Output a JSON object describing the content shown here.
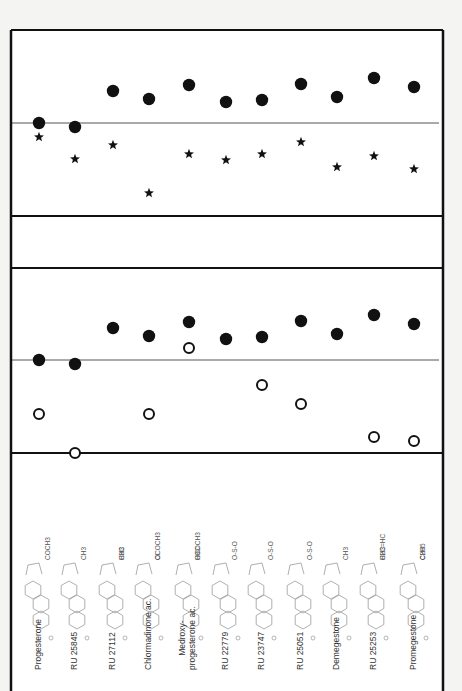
{
  "figure": {
    "background": "#ffffff",
    "ink": "#111111",
    "panels": [
      {
        "name": "panel-top",
        "top": 30,
        "bottom": 216,
        "reference_line_y": 123
      },
      {
        "name": "panel-gap",
        "top": 216,
        "bottom": 268
      },
      {
        "name": "panel-middle",
        "top": 268,
        "bottom": 453,
        "reference_line_y": 360
      },
      {
        "name": "panel-structures",
        "top": 453,
        "bottom": 691
      }
    ],
    "compounds": [
      {
        "name": "Progesterone",
        "x": 39
      },
      {
        "name": "RU 25845",
        "x": 75
      },
      {
        "name": "RU 27112",
        "x": 113
      },
      {
        "name": "Chlormadinone ac.",
        "x": 149
      },
      {
        "name": "Medroxy-",
        "name2": "progesterone ac.",
        "x": 189
      },
      {
        "name": "RU 22779",
        "x": 226
      },
      {
        "name": "RU 23747",
        "x": 262
      },
      {
        "name": "RU 25051",
        "x": 301
      },
      {
        "name": "Demegestone",
        "x": 337
      },
      {
        "name": "RU 25253",
        "x": 374
      },
      {
        "name": "Promegestone",
        "x": 414
      }
    ],
    "substituents": [
      {
        "text": "COCH3",
        "col": 0
      },
      {
        "text": "CH3",
        "col": 1
      },
      {
        "text": "CH3",
        "col": 2
      },
      {
        "text": "H3C",
        "col": 2
      },
      {
        "text": "OCOCH3",
        "col": 3
      },
      {
        "text": "Cl",
        "col": 3
      },
      {
        "text": "OCOCH3",
        "col": 4
      },
      {
        "text": "H3C",
        "col": 4
      },
      {
        "text": "O-S-O",
        "col": 5
      },
      {
        "text": "O-S-O",
        "col": 6
      },
      {
        "text": "O-S-O",
        "col": 7
      },
      {
        "text": "CH3",
        "col": 8
      },
      {
        "text": "CH3",
        "col": 9
      },
      {
        "text": "H2C=HC",
        "col": 9
      },
      {
        "text": "C2H5",
        "col": 10
      },
      {
        "text": "CH3",
        "col": 10
      }
    ]
  },
  "chart_data": [
    {
      "type": "scatter",
      "title": "",
      "xlabel": "",
      "ylabel": "",
      "categories": [
        "Progesterone",
        "RU 25845",
        "RU 27112",
        "Chlormadinone ac.",
        "Medroxyprogesterone ac.",
        "RU 22779",
        "RU 23747",
        "RU 25051",
        "Demegestone",
        "RU 25253",
        "Promegestone"
      ],
      "reference_line": 0,
      "grid": false,
      "series": [
        {
          "name": "filled-circle",
          "marker": "filled circle",
          "values": [
            0.0,
            -0.1,
            0.8,
            0.6,
            1.0,
            0.5,
            0.6,
            1.0,
            0.6,
            1.2,
            0.9
          ],
          "pixel_y": [
            123,
            127,
            91,
            99,
            85,
            102,
            100,
            84,
            97,
            78,
            87
          ]
        },
        {
          "name": "star",
          "marker": "star",
          "values": [
            -0.4,
            -0.9,
            -0.6,
            -1.8,
            -0.8,
            -0.9,
            -0.8,
            -0.5,
            -1.1,
            -0.8,
            -1.2
          ],
          "pixel_y": [
            137,
            159,
            145,
            193,
            154,
            160,
            154,
            142,
            167,
            156,
            169
          ]
        }
      ]
    },
    {
      "type": "scatter",
      "title": "",
      "xlabel": "",
      "ylabel": "",
      "categories": [
        "Progesterone",
        "RU 25845",
        "RU 27112",
        "Chlormadinone ac.",
        "Medroxyprogesterone ac.",
        "RU 22779",
        "RU 23747",
        "RU 25051",
        "Demegestone",
        "RU 25253",
        "Promegestone"
      ],
      "reference_line": 0,
      "grid": false,
      "series": [
        {
          "name": "filled-circle",
          "marker": "filled circle",
          "values": [
            0.0,
            -0.1,
            0.8,
            0.6,
            1.0,
            0.5,
            0.6,
            1.0,
            0.6,
            1.2,
            0.9
          ],
          "pixel_y": [
            360,
            364,
            328,
            336,
            322,
            339,
            337,
            321,
            334,
            315,
            324
          ]
        },
        {
          "name": "open-circle",
          "marker": "open circle",
          "values": [
            -1.4,
            -2.5,
            null,
            -1.4,
            0.3,
            null,
            -0.7,
            -1.2,
            null,
            -2.1,
            -2.2
          ],
          "pixel_y": [
            414,
            453,
            null,
            414,
            348,
            null,
            385,
            404,
            null,
            437,
            441
          ]
        }
      ]
    }
  ]
}
